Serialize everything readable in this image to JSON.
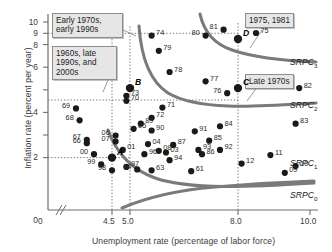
{
  "chart_data": {
    "type": "scatter",
    "title": "",
    "xlabel": "Unemployment rate (percentage of labor force)",
    "ylabel": "Inflation rate (percent per year)",
    "xlim": [
      3.0,
      10.6
    ],
    "ylim": [
      0,
      10.6
    ],
    "xticks": [
      "0",
      "4.5",
      "5.0",
      "8.0",
      "10.0"
    ],
    "yticks": [
      "0",
      "2",
      "4",
      "6",
      "8",
      "9",
      "10"
    ],
    "grid": false,
    "axis_break": true,
    "gridlines": {
      "horizontal": [
        2.0,
        6.1,
        9.0
      ],
      "vertical": [
        4.5,
        5.0,
        8.0
      ]
    },
    "legend_position": "right-inline-curve-labels",
    "points": [
      {
        "label": "61",
        "x": 6.7,
        "y": 1.2
      },
      {
        "label": "63",
        "x": 5.6,
        "y": 1.25
      },
      {
        "label": "64",
        "x": 5.2,
        "y": 1.3
      },
      {
        "label": "66",
        "x": 3.8,
        "y": 2.85
      },
      {
        "label": "67",
        "x": 3.8,
        "y": 3.05
      },
      {
        "label": "68",
        "x": 3.6,
        "y": 4.2
      },
      {
        "label": "69",
        "x": 3.5,
        "y": 4.9
      },
      {
        "label": "70",
        "x": 4.9,
        "y": 5.35
      },
      {
        "label": "71",
        "x": 5.9,
        "y": 4.95
      },
      {
        "label": "72",
        "x": 5.6,
        "y": 4.35
      },
      {
        "label": "73",
        "x": 4.9,
        "y": 5.65
      },
      {
        "label": "74",
        "x": 5.6,
        "y": 9.2
      },
      {
        "label": "75",
        "x": 8.5,
        "y": 9.35
      },
      {
        "label": "76",
        "x": 7.7,
        "y": 5.8
      },
      {
        "label": "77",
        "x": 7.1,
        "y": 6.5
      },
      {
        "label": "78",
        "x": 6.1,
        "y": 7.05
      },
      {
        "label": "79",
        "x": 5.8,
        "y": 8.3
      },
      {
        "label": "80",
        "x": 7.1,
        "y": 9.2
      },
      {
        "label": "81",
        "x": 7.6,
        "y": 9.55
      },
      {
        "label": "82",
        "x": 9.7,
        "y": 6.1
      },
      {
        "label": "83",
        "x": 9.6,
        "y": 4.0
      },
      {
        "label": "84",
        "x": 7.5,
        "y": 3.85
      },
      {
        "label": "85",
        "x": 7.2,
        "y": 3.0
      },
      {
        "label": "86",
        "x": 7.0,
        "y": 2.2
      },
      {
        "label": "87",
        "x": 6.2,
        "y": 2.75
      },
      {
        "label": "89",
        "x": 5.3,
        "y": 4.0
      },
      {
        "label": "90",
        "x": 5.6,
        "y": 3.6
      },
      {
        "label": "91",
        "x": 6.8,
        "y": 3.55
      },
      {
        "label": "92",
        "x": 7.5,
        "y": 2.45
      },
      {
        "label": "93",
        "x": 6.9,
        "y": 2.45
      },
      {
        "label": "94",
        "x": 6.1,
        "y": 1.85
      },
      {
        "label": "96",
        "x": 5.4,
        "y": 2.2
      },
      {
        "label": "97",
        "x": 4.9,
        "y": 1.45
      },
      {
        "label": "98",
        "x": 4.5,
        "y": 1.25
      },
      {
        "label": "99",
        "x": 4.2,
        "y": 1.6
      },
      {
        "label": "00",
        "x": 4.0,
        "y": 2.2
      },
      {
        "label": "01",
        "x": 4.8,
        "y": 2.45
      },
      {
        "label": "03",
        "x": 6.0,
        "y": 2.3
      },
      {
        "label": "04",
        "x": 5.5,
        "y": 2.8
      },
      {
        "label": "05",
        "x": 5.1,
        "y": 3.7
      },
      {
        "label": "06",
        "x": 4.6,
        "y": 3.3
      },
      {
        "label": "07",
        "x": 4.6,
        "y": 2.95
      },
      {
        "label": "08",
        "x": 5.8,
        "y": 2.4
      },
      {
        "label": "09",
        "x": 9.3,
        "y": 1.1
      },
      {
        "label": "10",
        "x": 9.6,
        "y": 1.5
      },
      {
        "label": "11",
        "x": 8.9,
        "y": 2.15
      },
      {
        "label": "12",
        "x": 8.1,
        "y": 1.65
      }
    ],
    "key_points": [
      {
        "label": "A",
        "x": 4.5,
        "y": 2.0
      },
      {
        "label": "B",
        "x": 5.0,
        "y": 6.1
      },
      {
        "label": "C",
        "x": 8.0,
        "y": 6.1
      },
      {
        "label": "D",
        "x": 8.0,
        "y": 9.0
      }
    ],
    "curves": [
      {
        "name": "SRPC",
        "subscript": "0",
        "expected_inflation": 2.0
      },
      {
        "name": "SRPC",
        "subscript": "1",
        "expected_inflation": 3.0
      },
      {
        "name": "SRPC",
        "subscript": "2",
        "expected_inflation": 6.1
      },
      {
        "name": "SRPC",
        "subscript": "3",
        "expected_inflation": 9.0
      }
    ],
    "annotations": [
      {
        "id": "early-1970s",
        "text": "Early 1970s,\nearly 1990s"
      },
      {
        "id": "1960s-late-1990s",
        "text": "1960s, late\n1990s, and\n2000s"
      },
      {
        "id": "1975-1981",
        "text": "1975, 1981"
      },
      {
        "id": "late-1970s",
        "text": "Late 1970s"
      }
    ]
  },
  "colors": {
    "curve": "#7a7a7a",
    "point": "#1a1a1a",
    "axis": "#6e6e6e",
    "text": "#2a2a2a",
    "callout_bg": "#e6e6e6",
    "callout_border": "#8d8d8d"
  }
}
